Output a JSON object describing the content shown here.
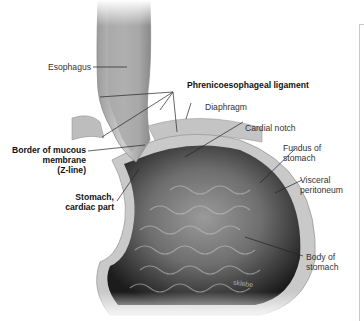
{
  "figure": {
    "type": "anatomical-illustration",
    "signature": "sklebe"
  },
  "labels": {
    "esophagus": "Esophagus",
    "phrenicoesophageal_ligament": "Phrenicoesophageal ligament",
    "diaphragm": "Diaphragm",
    "cardial_notch": "Cardial notch",
    "border_line1": "Border of mucous",
    "border_line2": "membrane",
    "border_line3": "(Z-line)",
    "fundus_line1": "Fundus of",
    "fundus_line2": "stomach",
    "cardiac_line1": "Stomach,",
    "cardiac_line2": "cardiac part",
    "visceral_line1": "Visceral",
    "visceral_line2": "peritoneum",
    "body_line1": "Body of",
    "body_line2": "stomach"
  },
  "colors": {
    "tissue_dark": "#2a2a2a",
    "tissue_mid": "#8a8a8a",
    "tissue_light": "#d8d8d8",
    "label_text": "#333333",
    "leader_line": "#222222"
  }
}
